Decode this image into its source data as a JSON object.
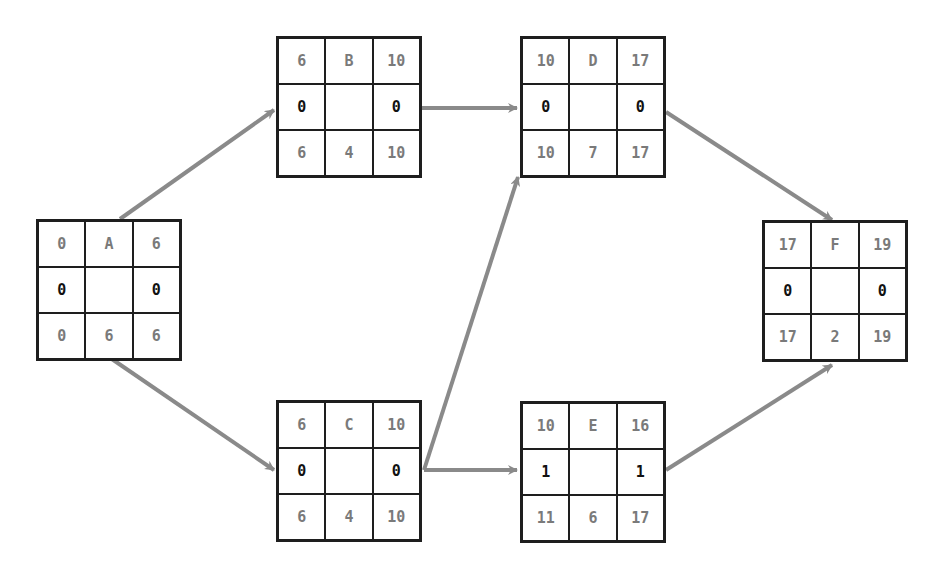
{
  "diagram": {
    "type": "activity-on-node network",
    "colors": {
      "border": "#1e1e1e",
      "arrow": "#8a8a8a",
      "value_text": "#7a7a7a",
      "slack_text": "#111111"
    },
    "nodes": [
      {
        "id": "A",
        "es": "0",
        "name": "A",
        "ef": "6",
        "slack_left": "0",
        "slack_right": "0",
        "ls": "0",
        "duration": "6",
        "lf": "6"
      },
      {
        "id": "B",
        "es": "6",
        "name": "B",
        "ef": "10",
        "slack_left": "0",
        "slack_right": "0",
        "ls": "6",
        "duration": "4",
        "lf": "10"
      },
      {
        "id": "C",
        "es": "6",
        "name": "C",
        "ef": "10",
        "slack_left": "0",
        "slack_right": "0",
        "ls": "6",
        "duration": "4",
        "lf": "10"
      },
      {
        "id": "D",
        "es": "10",
        "name": "D",
        "ef": "17",
        "slack_left": "0",
        "slack_right": "0",
        "ls": "10",
        "duration": "7",
        "lf": "17"
      },
      {
        "id": "E",
        "es": "10",
        "name": "E",
        "ef": "16",
        "slack_left": "1",
        "slack_right": "1",
        "ls": "11",
        "duration": "6",
        "lf": "17"
      },
      {
        "id": "F",
        "es": "17",
        "name": "F",
        "ef": "19",
        "slack_left": "0",
        "slack_right": "0",
        "ls": "17",
        "duration": "2",
        "lf": "19"
      }
    ],
    "edges": [
      {
        "from": "A",
        "to": "B"
      },
      {
        "from": "A",
        "to": "C"
      },
      {
        "from": "B",
        "to": "D"
      },
      {
        "from": "C",
        "to": "D"
      },
      {
        "from": "C",
        "to": "E"
      },
      {
        "from": "D",
        "to": "F"
      },
      {
        "from": "E",
        "to": "F"
      }
    ]
  }
}
